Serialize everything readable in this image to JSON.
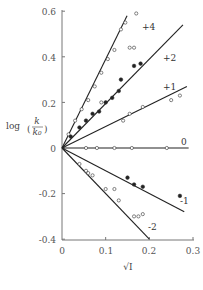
{
  "chart_data": {
    "type": "scatter",
    "title": "",
    "xlabel": "√I",
    "ylabel": "log(k/k0)",
    "xlim": [
      0,
      0.3
    ],
    "ylim": [
      -0.4,
      0.6
    ],
    "x_ticks": [
      "0",
      "0.1",
      "0.2",
      "0.3"
    ],
    "y_ticks": [
      "0.6",
      "0.4",
      "0.2",
      "0",
      "-0.2",
      "-0.4"
    ],
    "grid": false,
    "legend": "inline line labels",
    "series": [
      {
        "name": "+4",
        "marker": "open",
        "fit_line": {
          "x": [
            0,
            0.149
          ],
          "y": [
            0,
            0.58
          ]
        },
        "points": [
          [
            0.015,
            0.06
          ],
          [
            0.03,
            0.12
          ],
          [
            0.045,
            0.17
          ],
          [
            0.06,
            0.21
          ],
          [
            0.075,
            0.27
          ],
          [
            0.09,
            0.33
          ],
          [
            0.105,
            0.39
          ],
          [
            0.12,
            0.43
          ],
          [
            0.135,
            0.52
          ],
          [
            0.155,
            0.44
          ],
          [
            0.165,
            0.44
          ],
          [
            0.145,
            0.55
          ],
          [
            0.17,
            0.59
          ],
          [
            0.09,
            0.2
          ]
        ]
      },
      {
        "name": "+2",
        "marker": "filled",
        "fit_line": {
          "x": [
            0,
            0.277
          ],
          "y": [
            0,
            0.54
          ]
        },
        "points": [
          [
            0.02,
            0.05
          ],
          [
            0.04,
            0.09
          ],
          [
            0.055,
            0.12
          ],
          [
            0.07,
            0.15
          ],
          [
            0.085,
            0.16
          ],
          [
            0.1,
            0.2
          ],
          [
            0.115,
            0.22
          ],
          [
            0.13,
            0.25
          ],
          [
            0.135,
            0.3
          ],
          [
            0.165,
            0.36
          ],
          [
            0.18,
            0.37
          ]
        ]
      },
      {
        "name": "+1",
        "marker": "open",
        "fit_line": {
          "x": [
            0,
            0.286
          ],
          "y": [
            0,
            0.27
          ]
        },
        "points": [
          [
            0.14,
            0.12
          ],
          [
            0.155,
            0.15
          ],
          [
            0.185,
            0.18
          ],
          [
            0.25,
            0.21
          ],
          [
            0.27,
            0.23
          ]
        ]
      },
      {
        "name": "0",
        "marker": "open",
        "fit_line": {
          "x": [
            0,
            0.29
          ],
          "y": [
            0,
            0.0
          ]
        },
        "points": [
          [
            0.055,
            0.0
          ],
          [
            0.08,
            0.0
          ],
          [
            0.12,
            0.0
          ],
          [
            0.16,
            0.0
          ],
          [
            0.24,
            0.0
          ]
        ]
      },
      {
        "name": "-1",
        "marker": "filled",
        "fit_line": {
          "x": [
            0,
            0.28
          ],
          "y": [
            0,
            -0.28
          ]
        },
        "points": [
          [
            0.15,
            -0.13
          ],
          [
            0.165,
            -0.16
          ],
          [
            0.185,
            -0.17
          ],
          [
            0.27,
            -0.21
          ]
        ]
      },
      {
        "name": "-2",
        "marker": "open",
        "fit_line": {
          "x": [
            0,
            0.2
          ],
          "y": [
            0,
            -0.4
          ]
        },
        "points": [
          [
            0.04,
            -0.07
          ],
          [
            0.055,
            -0.1
          ],
          [
            0.06,
            -0.11
          ],
          [
            0.07,
            -0.12
          ],
          [
            0.1,
            -0.18
          ],
          [
            0.12,
            -0.18
          ],
          [
            0.13,
            -0.23
          ],
          [
            0.165,
            -0.3
          ],
          [
            0.175,
            -0.3
          ],
          [
            0.185,
            -0.29
          ]
        ]
      }
    ]
  },
  "labels": {
    "xlabel": "√I",
    "ylabel_log": "log",
    "ylabel_num": "k",
    "ylabel_den": "k₀",
    "x_ticks": [
      "0",
      "0.1",
      "0.2",
      "0.3"
    ],
    "y_ticks": [
      "0.6",
      "0.4",
      "0.2",
      "0",
      "-0.2",
      "-0.4"
    ],
    "series": [
      "+4",
      "+2",
      "+1",
      "0",
      "-1",
      "-2"
    ]
  }
}
